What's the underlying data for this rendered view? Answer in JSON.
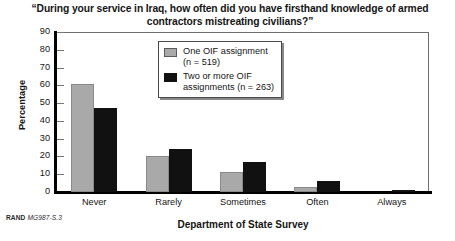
{
  "chart_data": {
    "type": "bar",
    "title": "“During your service in Iraq, how often did you have firsthand knowledge of armed contractors mistreating civilians?”",
    "xlabel": "Department of State Survey",
    "ylabel": "Percentage",
    "categories": [
      "Never",
      "Rarely",
      "Sometimes",
      "Often",
      "Always"
    ],
    "series": [
      {
        "name": "One OIF assignment (n = 519)",
        "color": "#a9a9a9",
        "values": [
          61,
          20,
          11,
          3,
          0
        ]
      },
      {
        "name": "Two or more OIF assignments (n = 263)",
        "color": "#111111",
        "values": [
          47,
          24,
          17,
          6,
          1
        ]
      }
    ],
    "ylim": [
      0,
      90
    ],
    "yticks": [
      0,
      10,
      20,
      30,
      40,
      50,
      60,
      70,
      80,
      90
    ],
    "ytick_labels": [
      "0",
      "10",
      "20",
      "30",
      "40",
      "50",
      "60",
      "70",
      "80",
      "90"
    ],
    "grid": false,
    "legend_position": "upper center"
  },
  "legend": {
    "entries": [
      {
        "label": "One OIF assignment\n(n = 519)"
      },
      {
        "label": "Two or more OIF\nassignments (n = 263)"
      }
    ]
  },
  "source": {
    "brand": "RAND",
    "code": "MG987-S.3"
  }
}
